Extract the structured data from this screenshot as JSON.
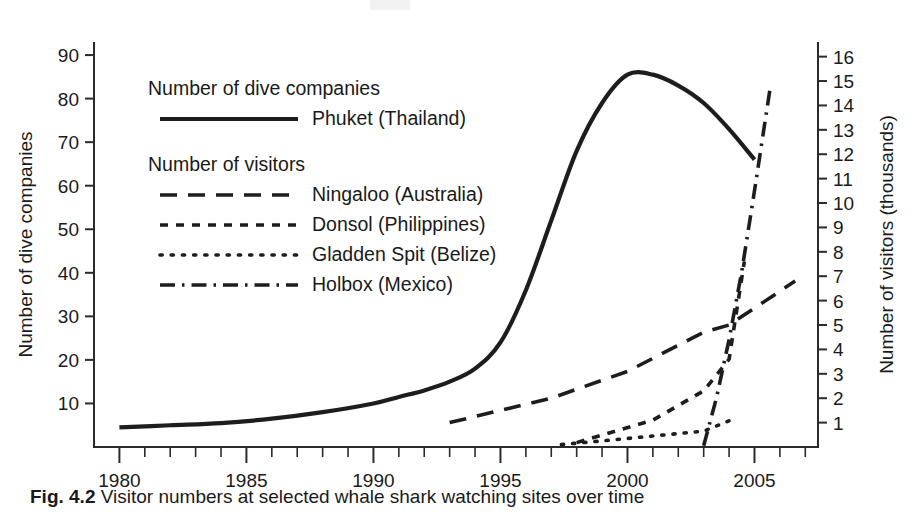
{
  "caption": {
    "number": "Fig. 4.2",
    "text": "Visitor numbers at selected whale shark watching sites over time"
  },
  "chart_data": {
    "type": "line",
    "title": "",
    "xlabel": "",
    "ylabel": "Number of dive companies",
    "y2label": "Number of visitors (thousands)",
    "xlim": [
      1979,
      2007.5
    ],
    "ylim": [
      0,
      93
    ],
    "y2lim": [
      0,
      16.6
    ],
    "grid": false,
    "legend_position": "upper-left-inside",
    "x_tick_labels": [
      "1980",
      "1985",
      "1990",
      "1995",
      "2000",
      "2005"
    ],
    "x_major_ticks": [
      1980,
      1985,
      1990,
      1995,
      2000,
      2005
    ],
    "x_minor_tick_step": 1,
    "y_left_ticks": [
      10,
      20,
      30,
      40,
      50,
      60,
      70,
      80,
      90
    ],
    "y_right_ticks": [
      1,
      2,
      3,
      4,
      5,
      6,
      7,
      8,
      9,
      10,
      11,
      12,
      13,
      14,
      15,
      16
    ],
    "legend_groups": [
      {
        "title": "Number of dive companies",
        "entries": [
          {
            "label": "Phuket (Thailand)",
            "style": "solid",
            "axis": "left"
          }
        ]
      },
      {
        "title": "Number of visitors",
        "entries": [
          {
            "label": "Ningaloo (Australia)",
            "style": "dashed",
            "axis": "right"
          },
          {
            "label": "Donsol (Philippines)",
            "style": "short-dashed",
            "axis": "right"
          },
          {
            "label": "Gladden Spit (Belize)",
            "style": "dotted",
            "axis": "right"
          },
          {
            "label": "Holbox (Mexico)",
            "style": "dash-dot",
            "axis": "right"
          }
        ]
      }
    ],
    "series": [
      {
        "name": "Phuket (Thailand)",
        "axis": "left",
        "unit": "dive companies",
        "style": "solid",
        "x": [
          1980,
          1982,
          1984,
          1986,
          1988,
          1990,
          1991,
          1992,
          1993,
          1994,
          1995,
          1996,
          1997,
          1998,
          1999,
          2000,
          2001,
          2002,
          2003,
          2004,
          2005
        ],
        "values": [
          4.5,
          5,
          5.5,
          6.5,
          8,
          10,
          11.5,
          13,
          15,
          18,
          24,
          36,
          52,
          68,
          79,
          85.5,
          85.5,
          83,
          79,
          73,
          66
        ]
      },
      {
        "name": "Ningaloo (Australia)",
        "axis": "right",
        "unit": "thousand visitors",
        "style": "dashed",
        "x": [
          1993,
          1997,
          2000,
          2003,
          2004,
          2006.6
        ],
        "values": [
          1.0,
          2.0,
          3.1,
          4.7,
          5.0,
          6.8
        ]
      },
      {
        "name": "Donsol (Philippines)",
        "axis": "right",
        "unit": "thousand visitors",
        "style": "short-dashed",
        "x": [
          1998,
          2001,
          2003,
          2004,
          2004.6
        ],
        "values": [
          0.18,
          1.1,
          2.3,
          3.6,
          7.6
        ]
      },
      {
        "name": "Gladden Spit (Belize)",
        "axis": "right",
        "unit": "thousand visitors",
        "style": "dotted",
        "x": [
          1997.4,
          1999,
          2001,
          2003,
          2004.3
        ],
        "values": [
          0.1,
          0.25,
          0.45,
          0.65,
          1.2
        ]
      },
      {
        "name": "Holbox (Mexico)",
        "axis": "right",
        "unit": "thousand visitors",
        "style": "dash-dot",
        "x": [
          2003,
          2003.5,
          2004,
          2004.5,
          2005,
          2005.6
        ],
        "values": [
          0.05,
          2.0,
          4.4,
          7.2,
          10.5,
          14.6
        ]
      }
    ]
  }
}
